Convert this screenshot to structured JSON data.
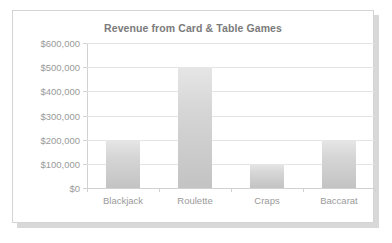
{
  "chart_data": {
    "type": "bar",
    "title": "Revenue from Card & Table Games",
    "xlabel": "",
    "ylabel": "",
    "categories": [
      "Blackjack",
      "Roulette",
      "Craps",
      "Baccarat"
    ],
    "values": [
      200000,
      500000,
      100000,
      200000
    ],
    "ylim": [
      0,
      600000
    ],
    "ytick_values": [
      0,
      100000,
      200000,
      300000,
      400000,
      500000,
      600000
    ],
    "ytick_labels": [
      "$0",
      "$100,000",
      "$200,000",
      "$300,000",
      "$400,000",
      "$500,000",
      "$600,000"
    ],
    "grid": true,
    "legend": false,
    "bar_color": "#d2d2d2",
    "text_color": "#9a9a9a",
    "title_color": "#7b7b7b",
    "gridline_color": "#e4e4e4",
    "axis_color": "#d2d2d2",
    "card_background": "#ffffff",
    "card_border_color": "#d4d4d4"
  }
}
